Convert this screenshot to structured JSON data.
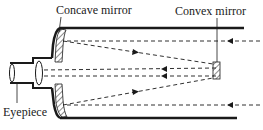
{
  "diagram": {
    "labels": {
      "concave_mirror": "Concave mirror",
      "convex_mirror": "Convex mirror",
      "eyepiece": "Eyepiece"
    },
    "components": [
      "tube",
      "concave-primary-mirror",
      "convex-secondary-mirror",
      "eyepiece-lens",
      "eyepiece-tube"
    ],
    "rays": [
      {
        "id": "incoming-top",
        "direction": "right-to-left"
      },
      {
        "id": "incoming-bottom",
        "direction": "right-to-left"
      },
      {
        "id": "reflected-top",
        "direction": "left-to-right"
      },
      {
        "id": "reflected-bottom",
        "direction": "left-to-right"
      },
      {
        "id": "to-eyepiece-upper",
        "direction": "right-to-left"
      },
      {
        "id": "to-eyepiece-lower",
        "direction": "right-to-left"
      }
    ],
    "colors": {
      "ink": "#1a1a1a",
      "background": "#ffffff"
    }
  }
}
